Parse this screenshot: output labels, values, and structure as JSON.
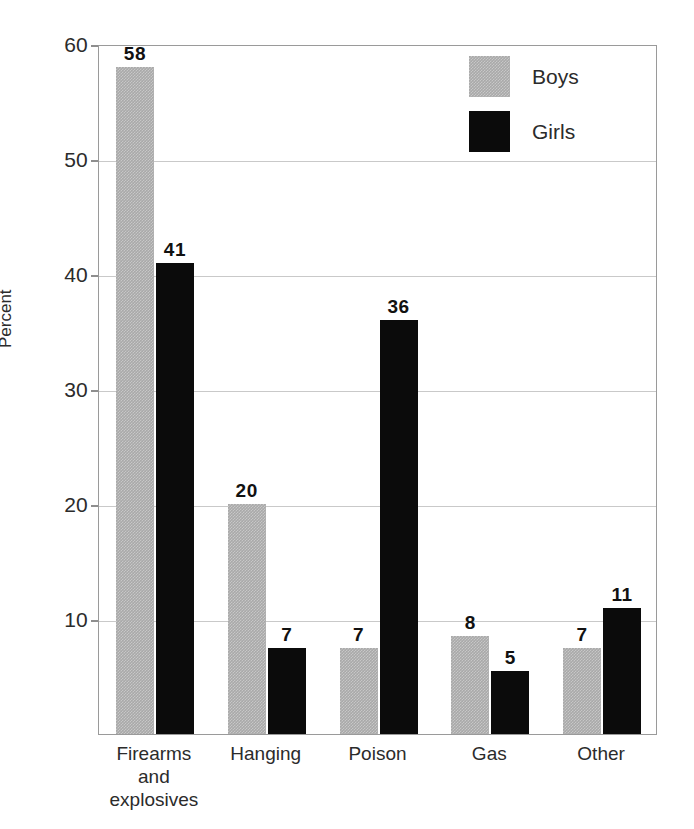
{
  "chart_data": {
    "type": "bar",
    "title": "",
    "subtitle": "",
    "xlabel": "",
    "ylabel": "Percent",
    "ylim": [
      0,
      60
    ],
    "yticks": [
      10,
      20,
      30,
      40,
      50,
      60
    ],
    "grid": true,
    "legend_position": "top-right-inside",
    "categories": [
      "Firearms and explosives",
      "Hanging",
      "Poison",
      "Gas",
      "Other"
    ],
    "category_label_lines": [
      [
        "Firearms",
        "and",
        "explosives"
      ],
      [
        "Hanging"
      ],
      [
        "Poison"
      ],
      [
        "Gas"
      ],
      [
        "Other"
      ]
    ],
    "series": [
      {
        "name": "Boys",
        "color": "#a9a9a9",
        "values": [
          58,
          20,
          7,
          8,
          7
        ]
      },
      {
        "name": "Girls",
        "color": "#0b0b0b",
        "values": [
          41,
          7,
          36,
          5,
          11
        ]
      }
    ],
    "value_labels": {
      "boys": [
        "58",
        "20",
        "7",
        "8",
        "7"
      ],
      "girls": [
        "41",
        "7",
        "36",
        "5",
        "11"
      ]
    }
  },
  "legend": {
    "items": [
      {
        "label": "Boys",
        "swatch": "boys-swatch"
      },
      {
        "label": "Girls",
        "swatch": "girls-swatch"
      }
    ]
  },
  "axis": {
    "y_title": "Percent",
    "y_tick_labels": [
      "60",
      "50",
      "40",
      "30",
      "20",
      "10"
    ]
  },
  "caption_sliver": ""
}
